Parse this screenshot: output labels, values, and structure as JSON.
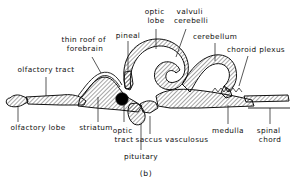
{
  "figure": {
    "caption": "(b)",
    "title_internal": "sagittal-section-of-fish-brain",
    "colors": {
      "ink": "#111111",
      "background": "#ffffff",
      "hatch": "#111111",
      "optic_tract_dot": "#000000"
    }
  },
  "labels": [
    {
      "id": "olfactory-tract",
      "text": "olfactory tract",
      "lines": [
        "olfactory tract"
      ],
      "anchor": "middle",
      "x": 46,
      "y": 74,
      "leader": [
        [
          46,
          77
        ],
        [
          46,
          96
        ]
      ]
    },
    {
      "id": "olfactory-lobe",
      "text": "olfactory lobe",
      "lines": [
        "olfactory lobe"
      ],
      "anchor": "middle",
      "x": 38,
      "y": 126,
      "leader": [
        [
          18,
          122
        ],
        [
          18,
          106
        ]
      ]
    },
    {
      "id": "striatum",
      "text": "striatum",
      "lines": [
        "striatum"
      ],
      "anchor": "middle",
      "x": 96,
      "y": 126,
      "leader": [
        [
          98,
          122
        ],
        [
          98,
          96
        ]
      ]
    },
    {
      "id": "thin-roof-of-forebrain",
      "text": "thin roof of forebrain",
      "lines": [
        "thin roof of",
        "forebrain"
      ],
      "anchor": "middle",
      "x": 85,
      "y": 45,
      "leader": [
        [
          92,
          56
        ],
        [
          101,
          72
        ]
      ]
    },
    {
      "id": "pineal",
      "text": "pineal",
      "lines": [
        "pineal"
      ],
      "anchor": "middle",
      "x": 128,
      "y": 38,
      "leader": [
        [
          128,
          41
        ],
        [
          128,
          72
        ]
      ]
    },
    {
      "id": "optic-lobe",
      "text": "optic lobe",
      "lines": [
        "optic",
        "lobe"
      ],
      "anchor": "middle",
      "x": 156,
      "y": 16,
      "leader": [
        [
          156,
          27
        ],
        [
          156,
          48
        ]
      ]
    },
    {
      "id": "valvuli-cerebelli",
      "text": "valvuli cerebelli",
      "lines": [
        "valvuli",
        "cerebelli"
      ],
      "anchor": "middle",
      "x": 190,
      "y": 16,
      "leader": [
        [
          186,
          27
        ],
        [
          176,
          56
        ]
      ]
    },
    {
      "id": "cerebellum",
      "text": "cerebellum",
      "lines": [
        "cerebellum"
      ],
      "anchor": "middle",
      "x": 215,
      "y": 40,
      "leader": [
        [
          215,
          43
        ],
        [
          215,
          60
        ]
      ]
    },
    {
      "id": "choroid-plexus",
      "text": "choroid plexus",
      "lines": [
        "choroid plexus"
      ],
      "anchor": "middle",
      "x": 258,
      "y": 52,
      "leader": [
        [
          248,
          55
        ],
        [
          240,
          85
        ]
      ]
    },
    {
      "id": "medulla",
      "text": "medulla",
      "lines": [
        "medulla"
      ],
      "anchor": "middle",
      "x": 228,
      "y": 131,
      "leader": [
        [
          228,
          124
        ],
        [
          228,
          108
        ]
      ]
    },
    {
      "id": "spinal-chord",
      "text": "spinal chord",
      "lines": [
        "spinal",
        "chord"
      ],
      "anchor": "middle",
      "x": 270,
      "y": 131,
      "leader": [
        [
          270,
          124
        ],
        [
          270,
          108
        ]
      ]
    },
    {
      "id": "saccus-vasculosus",
      "text": "saccus vasculosus",
      "lines": [
        "saccus vasculosus"
      ],
      "anchor": "middle",
      "x": 168,
      "y": 139,
      "leader": [
        [
          150,
          134
        ],
        [
          150,
          118
        ]
      ]
    },
    {
      "id": "optic-tract",
      "text": "optic tract",
      "lines": [
        "optic",
        "tract"
      ],
      "anchor": "middle",
      "x": 124,
      "y": 131,
      "leader": [
        [
          124,
          122
        ],
        [
          124,
          102
        ]
      ]
    },
    {
      "id": "pituitary",
      "text": "pituitary",
      "lines": [
        "pituitary"
      ],
      "anchor": "middle",
      "x": 141,
      "y": 157,
      "leader": [
        [
          141,
          150
        ],
        [
          141,
          124
        ]
      ]
    }
  ]
}
